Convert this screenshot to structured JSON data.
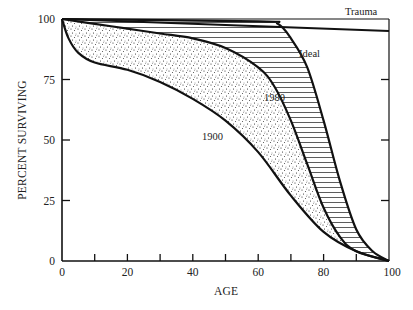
{
  "chart_data": {
    "type": "line",
    "title": "",
    "xlabel": "AGE",
    "ylabel": "PERCENT SURVIVING",
    "xlim": [
      0,
      100
    ],
    "ylim": [
      0,
      100
    ],
    "x_ticks": [
      0,
      10,
      20,
      30,
      40,
      50,
      60,
      70,
      80,
      90,
      100
    ],
    "x_tick_labels": [
      "0",
      "20",
      "40",
      "60",
      "80",
      "100"
    ],
    "y_ticks": [
      0,
      25,
      50,
      75,
      100
    ],
    "y_tick_labels": [
      "0",
      "25",
      "50",
      "75",
      "100"
    ],
    "grid": false,
    "legend": "inline curve labels",
    "series": [
      {
        "name": "Trauma",
        "x": [
          0,
          100
        ],
        "y": [
          100,
          95
        ]
      },
      {
        "name": "Ideal",
        "x": [
          0,
          60,
          66,
          70,
          75,
          80,
          85,
          90,
          95,
          100
        ],
        "y": [
          100,
          99,
          98,
          92,
          80,
          58,
          33,
          13,
          4,
          0
        ]
      },
      {
        "name": "1980",
        "x": [
          0,
          10,
          20,
          30,
          40,
          50,
          60,
          65,
          70,
          75,
          80,
          85,
          90,
          100
        ],
        "y": [
          100,
          98,
          96,
          94,
          92,
          88,
          80,
          72,
          58,
          40,
          22,
          10,
          4,
          0
        ]
      },
      {
        "name": "1900",
        "x": [
          0,
          2,
          5,
          10,
          20,
          30,
          40,
          50,
          60,
          70,
          80,
          90,
          100
        ],
        "y": [
          100,
          92,
          86,
          82,
          79,
          74,
          67,
          58,
          45,
          27,
          12,
          4,
          0
        ]
      }
    ],
    "annotations": [
      {
        "text": "Trauma",
        "x": 88,
        "y": 97.5
      },
      {
        "text": "Ideal",
        "x": 73,
        "y": 86
      },
      {
        "text": "1980",
        "x": 63,
        "y": 67
      },
      {
        "text": "1900",
        "x": 44,
        "y": 50
      }
    ],
    "fills": [
      {
        "between": [
          "1900",
          "1980"
        ],
        "pattern": "stipple"
      },
      {
        "between": [
          "1980",
          "Ideal"
        ],
        "pattern": "horizontal-hatch"
      }
    ]
  },
  "labels": {
    "xlabel": "AGE",
    "ylabel": "PERCENT SURVIVING",
    "trauma": "Trauma",
    "ideal": "Ideal",
    "s1980": "1980",
    "s1900": "1900",
    "xt0": "0",
    "xt20": "20",
    "xt40": "40",
    "xt60": "60",
    "xt80": "80",
    "xt100": "100",
    "yt0": "0",
    "yt25": "25",
    "yt50": "50",
    "yt75": "75",
    "yt100": "100"
  }
}
